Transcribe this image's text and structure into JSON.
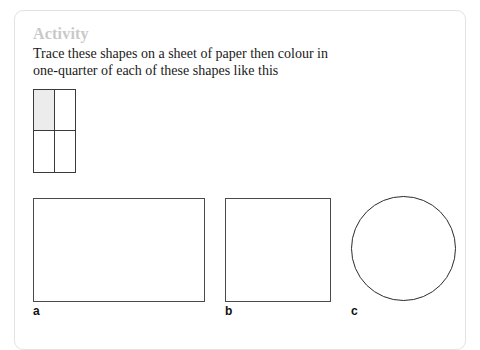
{
  "card": {
    "heading": "Activity",
    "instruction_line_1": "Trace these shapes on a sheet of paper then colour in",
    "instruction_line_2": "one-quarter of each of these shapes like this",
    "border_color": "#e2e2e2",
    "heading_color": "#c9c9c9",
    "background": "#ffffff"
  },
  "example": {
    "name": "quarter-shaded-grid",
    "rows": 2,
    "columns": 2,
    "shaded_cell": "top-left",
    "shaded_color": "#ececec",
    "stroke_color": "#3a3a3a"
  },
  "shapes": [
    {
      "label": "a",
      "type": "rectangle",
      "stroke_color": "#4a4a4a",
      "fill": "#ffffff"
    },
    {
      "label": "b",
      "type": "square",
      "stroke_color": "#4a4a4a",
      "fill": "#ffffff"
    },
    {
      "label": "c",
      "type": "circle",
      "stroke_color": "#2b2b2b",
      "fill": "#ffffff"
    }
  ]
}
